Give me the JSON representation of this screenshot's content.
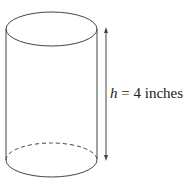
{
  "figure": {
    "shape": "cylinder",
    "height_label": {
      "variable": "h",
      "equals": "=",
      "value": "4 inches"
    },
    "stroke_color": "#444444",
    "background": "#ffffff"
  }
}
